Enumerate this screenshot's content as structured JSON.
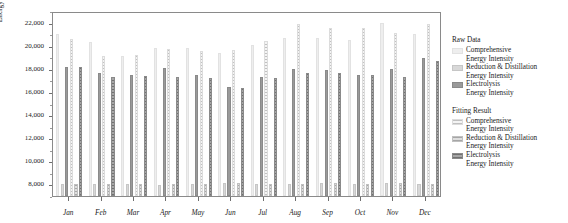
{
  "chart_data": {
    "type": "bar",
    "title": "",
    "subtitle": "",
    "xlabel": "",
    "ylabel": "Energy Intensity (kWh/t)",
    "ylim": [
      7000,
      23000
    ],
    "yticks": [
      8000,
      10000,
      12000,
      14000,
      16000,
      18000,
      20000,
      22000
    ],
    "ytick_labels": [
      "8,000",
      "10,000",
      "12,000",
      "14,000",
      "16,000",
      "18,000",
      "20,000",
      "22,000"
    ],
    "grid": false,
    "legend_position": "right",
    "categories": [
      "Jan",
      "Feb",
      "Mar",
      "Apr",
      "May",
      "Jun",
      "Jul",
      "Aug",
      "Sep",
      "Oct",
      "Nov",
      "Dec"
    ],
    "series": [
      {
        "name": "Raw Data Comprehensive Energy Intensity",
        "group": "Raw Data",
        "component": "Comprehensive Energy Intensity",
        "color": "#eeeeee",
        "values": [
          21000,
          20300,
          19100,
          19800,
          19800,
          19400,
          20100,
          20700,
          20700,
          20500,
          22000,
          21000
        ]
      },
      {
        "name": "Raw Data Reduction & Distillation Energy Intensity",
        "group": "Raw Data",
        "component": "Reduction & Distillation Energy Intensity",
        "color": "#d8d8d8",
        "values": [
          8050,
          8050,
          8000,
          7980,
          8050,
          8100,
          8050,
          8000,
          8100,
          8050,
          8100,
          8050
        ]
      },
      {
        "name": "Raw Data Electrolysis Energy Intensity",
        "group": "Raw Data",
        "component": "Electrolysis Energy Intensity",
        "color": "#9a9a9a",
        "values": [
          18150,
          17650,
          17450,
          18050,
          17500,
          16400,
          17300,
          17950,
          17900,
          17500,
          18000,
          18900
        ]
      },
      {
        "name": "Fitting Result Comprehensive Energy Intensity",
        "group": "Fitting Result",
        "component": "Comprehensive Energy Intensity",
        "color": "#f4f4f4",
        "values": [
          20600,
          19150,
          19200,
          19700,
          19500,
          19600,
          20400,
          21900,
          21500,
          21500,
          21100,
          21900
        ]
      },
      {
        "name": "Fitting Result Reduction & Distillation Energy Intensity",
        "group": "Fitting Result",
        "component": "Reduction & Distillation Energy Intensity",
        "color": "#dedede",
        "values": [
          8050,
          8050,
          8020,
          8000,
          8060,
          8100,
          8050,
          8050,
          8100,
          8050,
          8100,
          8060
        ]
      },
      {
        "name": "Fitting Result Electrolysis Energy Intensity",
        "group": "Fitting Result",
        "component": "Electrolysis Energy Intensity",
        "color": "#a6a6a6",
        "values": [
          18150,
          17300,
          17350,
          17300,
          17200,
          16350,
          17200,
          17600,
          17600,
          17500,
          17300,
          18700
        ]
      }
    ]
  },
  "legend": {
    "blocks": [
      {
        "title": "Raw Data",
        "entries": [
          {
            "swatch": "s-comprehensive-raw",
            "line1": "Comprehensive",
            "line2": "Energy Intensity"
          },
          {
            "swatch": "s-reduction-raw",
            "line1": "Reduction & Distillation",
            "line2": "Energy Intensity"
          },
          {
            "swatch": "s-electrolysis-raw",
            "line1": "Electrolysis",
            "line2": "Energy Intensity"
          }
        ]
      },
      {
        "title": "Fitting Result",
        "entries": [
          {
            "swatch": "s-comprehensive-fit",
            "line1": "Comprehensive",
            "line2": "Energy Intensity"
          },
          {
            "swatch": "s-reduction-fit",
            "line1": "Reduction & Distillation",
            "line2": "Energy Intensity"
          },
          {
            "swatch": "s-electrolysis-fit",
            "line1": "Electrolysis",
            "line2": "Energy Intensity"
          }
        ]
      }
    ]
  }
}
